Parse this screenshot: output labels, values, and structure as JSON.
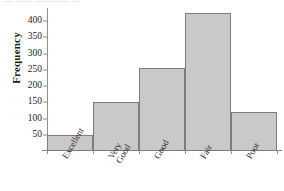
{
  "figure": {
    "top_clipped_text": "—  ——  ———— —",
    "background": "#ffffff",
    "bar_fill": "#c9c9c9",
    "bar_edge": "#7d7d7d",
    "axis_color": "#8e8e8e"
  },
  "chart_data": {
    "type": "bar",
    "title": "",
    "xlabel": "",
    "ylabel": "Frequency",
    "categories": [
      "Excellent",
      "Very\nGood",
      "Good",
      "Fair",
      "Poor"
    ],
    "values": [
      50,
      152,
      256,
      425,
      121
    ],
    "ylim": [
      0,
      440
    ],
    "yticks": [
      50,
      100,
      150,
      200,
      250,
      300,
      350,
      400
    ],
    "ytick_labels": [
      "50",
      "100",
      "150",
      "200",
      "250",
      "300",
      "350",
      "400"
    ],
    "grid": false,
    "legend": null,
    "bar_gap": 0,
    "orientation": "vertical"
  }
}
